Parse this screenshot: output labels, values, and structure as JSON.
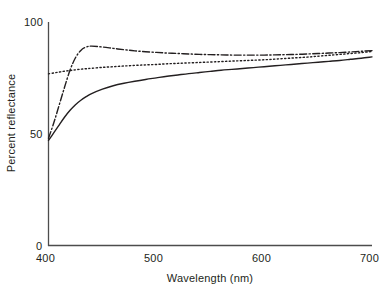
{
  "chart_data": {
    "type": "line",
    "title": "",
    "xlabel": "Wavelength (nm)",
    "ylabel": "Percent reflectance",
    "xlim": [
      400,
      700
    ],
    "ylim": [
      0,
      100
    ],
    "xticks": [
      400,
      500,
      600,
      700
    ],
    "yticks": [
      0,
      50,
      100
    ],
    "grid": false,
    "legend": "none",
    "axis_style": "left-and-bottom-spines",
    "x": [
      400,
      405,
      410,
      415,
      420,
      425,
      430,
      435,
      440,
      450,
      460,
      470,
      480,
      490,
      500,
      510,
      520,
      530,
      540,
      550,
      560,
      570,
      580,
      590,
      600,
      610,
      620,
      630,
      640,
      650,
      660,
      670,
      680,
      690,
      700
    ],
    "series": [
      {
        "name": "solid-curve",
        "style": "solid",
        "color": "#231f20",
        "values": [
          47.0,
          50.5,
          54.0,
          57.5,
          60.5,
          63.0,
          65.0,
          66.6,
          68.0,
          70.0,
          71.5,
          72.6,
          73.5,
          74.3,
          75.0,
          75.7,
          76.3,
          76.9,
          77.4,
          77.9,
          78.4,
          78.8,
          79.2,
          79.6,
          80.0,
          80.4,
          80.8,
          81.2,
          81.6,
          82.0,
          82.4,
          82.8,
          83.3,
          83.8,
          84.4
        ]
      },
      {
        "name": "dotted-curve",
        "style": "dotted",
        "color": "#231f20",
        "values": [
          76.8,
          77.2,
          77.6,
          78.0,
          78.3,
          78.6,
          78.9,
          79.1,
          79.3,
          79.7,
          80.0,
          80.3,
          80.6,
          80.8,
          81.0,
          81.3,
          81.5,
          81.7,
          81.9,
          82.1,
          82.3,
          82.5,
          82.7,
          82.9,
          83.1,
          83.4,
          83.7,
          84.0,
          84.3,
          84.7,
          85.1,
          85.5,
          85.9,
          86.3,
          86.8
        ]
      },
      {
        "name": "dash-dot-curve",
        "style": "dashdot",
        "color": "#231f20",
        "values": [
          48.0,
          55.0,
          63.0,
          71.0,
          78.5,
          84.0,
          87.3,
          88.8,
          89.2,
          88.8,
          88.2,
          87.6,
          87.1,
          86.7,
          86.4,
          86.1,
          85.9,
          85.7,
          85.5,
          85.4,
          85.3,
          85.2,
          85.2,
          85.2,
          85.2,
          85.3,
          85.4,
          85.5,
          85.7,
          85.9,
          86.1,
          86.3,
          86.6,
          86.9,
          87.2
        ]
      }
    ]
  },
  "axis": {
    "y_tick_labels": [
      "100",
      "50",
      "0"
    ],
    "x_tick_labels": [
      "400",
      "500",
      "600",
      "700"
    ],
    "x_title": "Wavelength (nm)",
    "y_title": "Percent reflectance"
  },
  "colors": {
    "axis": "#4d4d4d",
    "curve": "#231f20",
    "background": "#ffffff"
  }
}
